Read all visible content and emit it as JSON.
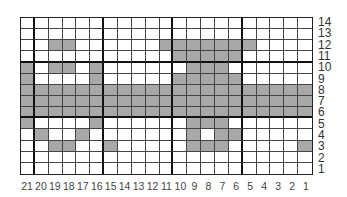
{
  "chart_data": {
    "type": "heatmap",
    "title": "",
    "columns": [
      21,
      20,
      19,
      18,
      17,
      16,
      15,
      14,
      13,
      12,
      11,
      10,
      9,
      8,
      7,
      6,
      5,
      4,
      3,
      2,
      1
    ],
    "rows": [
      14,
      13,
      12,
      11,
      10,
      9,
      8,
      7,
      6,
      5,
      4,
      3,
      2,
      1
    ],
    "filled_by_row": {
      "14": [],
      "13": [],
      "12": [
        19,
        18,
        11,
        10,
        9,
        8,
        7,
        6,
        5
      ],
      "11": [
        10,
        9,
        8,
        7,
        6
      ],
      "10": [
        21,
        19,
        18,
        16,
        9,
        8,
        7
      ],
      "9": [
        21,
        16,
        10,
        9,
        8,
        7,
        6
      ],
      "8": [
        21,
        20,
        19,
        18,
        17,
        16,
        15,
        14,
        13,
        12,
        11,
        10,
        9,
        8,
        7,
        6,
        5,
        4,
        3,
        2,
        1
      ],
      "7": [
        21,
        20,
        19,
        18,
        17,
        16,
        15,
        14,
        13,
        12,
        11,
        10,
        9,
        8,
        7,
        6,
        5,
        4,
        3,
        2,
        1
      ],
      "6": [
        21,
        20,
        19,
        18,
        17,
        16,
        15,
        14,
        13,
        12,
        11,
        10,
        9,
        8,
        7,
        6,
        5,
        4,
        3,
        2,
        1
      ],
      "5": [
        21,
        16,
        9,
        8,
        7
      ],
      "4": [
        20,
        17,
        9,
        7,
        6
      ],
      "3": [
        19,
        18,
        15,
        9,
        8,
        7,
        1
      ],
      "2": [],
      "1": []
    },
    "thick_column_dividers_after": [
      21,
      16,
      11,
      6
    ],
    "thick_row_dividers_above": [
      10,
      5
    ],
    "colors": {
      "filled": "#a8a8a8",
      "empty": "#ffffff",
      "grid": "#444444"
    },
    "xlabel": "",
    "ylabel": ""
  }
}
